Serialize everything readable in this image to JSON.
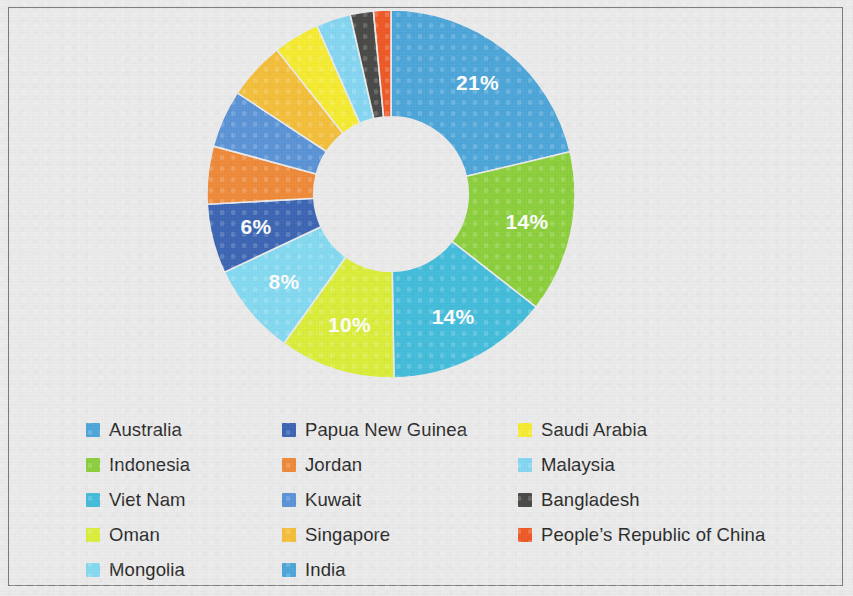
{
  "chart_data": {
    "type": "pie",
    "variant": "donut",
    "title": "",
    "subtitle": "",
    "xlabel": "",
    "ylabel": "",
    "grid": false,
    "legend_position": "bottom",
    "legend_columns": 3,
    "value_unit": "%",
    "start_angle_deg": 0,
    "direction": "clockwise",
    "inner_radius_ratio": 0.42,
    "labels_shown_threshold": 6,
    "categories": [
      "Australia",
      "Indonesia",
      "Viet Nam",
      "Oman",
      "Mongolia",
      "Papua New Guinea",
      "Jordan",
      "Kuwait",
      "Singapore",
      "Saudi Arabia",
      "Malaysia",
      "Bangladesh",
      "People's Republic of China"
    ],
    "values": [
      21,
      14,
      14,
      10,
      8,
      6,
      5,
      5,
      5,
      4,
      3,
      2,
      1.5
    ],
    "data_labels": [
      "21%",
      "14%",
      "14%",
      "10%",
      "8%",
      "6%",
      "",
      "",
      "",
      "",
      "",
      "",
      ""
    ],
    "colors": [
      "#4EA7DA",
      "#8DD13E",
      "#45BEDC",
      "#DCEF3C",
      "#85DBF2",
      "#3E67B5",
      "#F08B3C",
      "#5C95D8",
      "#F5C03C",
      "#F7ED33",
      "#86D8F4",
      "#4A4A48",
      "#F05A28"
    ]
  },
  "legend": {
    "columns": [
      [
        {
          "label": "Australia",
          "color": "#4EA7DA"
        },
        {
          "label": "Indonesia",
          "color": "#8DD13E"
        },
        {
          "label": "Viet Nam",
          "color": "#45BEDC"
        },
        {
          "label": "Oman",
          "color": "#DCEF3C"
        },
        {
          "label": "Mongolia",
          "color": "#85DBF2"
        }
      ],
      [
        {
          "label": "Papua New Guinea",
          "color": "#3E67B5"
        },
        {
          "label": "Jordan",
          "color": "#F08B3C"
        },
        {
          "label": "Kuwait",
          "color": "#5C95D8"
        },
        {
          "label": "Singapore",
          "color": "#F5C03C"
        },
        {
          "label": "India",
          "color": "#4EA7DA"
        }
      ],
      [
        {
          "label": "Saudi Arabia",
          "color": "#F7ED33"
        },
        {
          "label": "Malaysia",
          "color": "#86D8F4"
        },
        {
          "label": "Bangladesh",
          "color": "#4A4A48"
        },
        {
          "label": "People’s Republic of China",
          "color": "#F05A28"
        }
      ]
    ]
  },
  "page": {
    "background_color": "#ececec",
    "border_color": "#7c7f82",
    "label_text_color": "#2a2a2a",
    "data_label_color": "#ffffff"
  }
}
